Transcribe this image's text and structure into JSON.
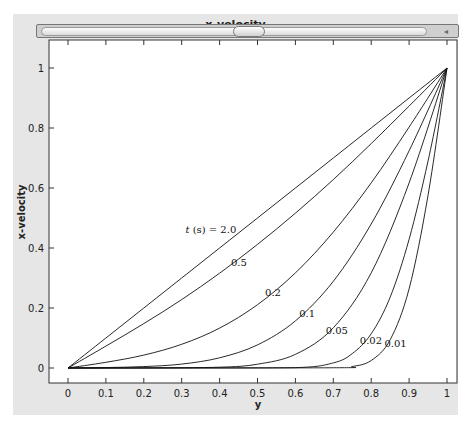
{
  "window": {
    "title": "x-velocity",
    "scrollbar": {
      "arrow_icon": "◂"
    }
  },
  "chart_data": {
    "type": "line",
    "title": "x-velocity",
    "xlabel": "y",
    "ylabel": "x-velocity",
    "xlim": [
      0,
      1
    ],
    "ylim": [
      0,
      1
    ],
    "grid": false,
    "legend": "inline curve labels",
    "xticks": [
      "0",
      "0.1",
      "0.2",
      "0.3",
      "0.4",
      "0.5",
      "0.6",
      "0.7",
      "0.8",
      "0.9",
      "1"
    ],
    "yticks": [
      "0",
      "0.2",
      "0.4",
      "0.6",
      "0.8",
      "1"
    ],
    "annotation_prefix": "t (s) = ",
    "series": [
      {
        "name": "2.0",
        "label": "t (s) = 2.0",
        "label_pos": [
          0.31,
          0.45
        ],
        "x": [
          0,
          0.1,
          0.2,
          0.3,
          0.4,
          0.5,
          0.6,
          0.7,
          0.8,
          0.9,
          1
        ],
        "y": [
          0,
          0.1,
          0.2,
          0.3,
          0.4,
          0.5,
          0.6,
          0.7,
          0.8,
          0.9,
          1
        ]
      },
      {
        "name": "0.5",
        "label": "0.5",
        "label_pos": [
          0.43,
          0.34
        ],
        "x": [
          0,
          0.1,
          0.2,
          0.3,
          0.4,
          0.5,
          0.6,
          0.7,
          0.8,
          0.9,
          1
        ],
        "y": [
          0,
          0.073,
          0.148,
          0.228,
          0.316,
          0.412,
          0.516,
          0.628,
          0.748,
          0.873,
          1
        ]
      },
      {
        "name": "0.2",
        "label": "0.2",
        "label_pos": [
          0.52,
          0.24
        ],
        "x": [
          0,
          0.1,
          0.2,
          0.3,
          0.4,
          0.5,
          0.6,
          0.7,
          0.8,
          0.9,
          1
        ],
        "y": [
          0,
          0.019,
          0.043,
          0.079,
          0.133,
          0.211,
          0.317,
          0.453,
          0.617,
          0.803,
          1
        ]
      },
      {
        "name": "0.1",
        "label": "0.1",
        "label_pos": [
          0.61,
          0.17
        ],
        "x": [
          0,
          0.1,
          0.2,
          0.3,
          0.4,
          0.5,
          0.6,
          0.7,
          0.8,
          0.9,
          1
        ],
        "y": [
          0,
          0.0015,
          0.0047,
          0.013,
          0.034,
          0.077,
          0.157,
          0.289,
          0.48,
          0.724,
          1
        ]
      },
      {
        "name": "0.05",
        "label": "0.05",
        "label_pos": [
          0.68,
          0.115
        ],
        "x": [
          0,
          0.2,
          0.4,
          0.5,
          0.6,
          0.7,
          0.8,
          0.9,
          1
        ],
        "y": [
          0,
          0.0003,
          0.0027,
          0.0127,
          0.0455,
          0.134,
          0.317,
          0.617,
          1
        ]
      },
      {
        "name": "0.02",
        "label": "0.02",
        "label_pos": [
          0.77,
          0.08
        ],
        "x": [
          0,
          0.3,
          0.6,
          0.7,
          0.75,
          0.8,
          0.85,
          0.9,
          0.95,
          1
        ],
        "y": [
          0,
          0.0003,
          0.0012,
          0.017,
          0.048,
          0.114,
          0.236,
          0.429,
          0.69,
          1
        ]
      },
      {
        "name": "0.01",
        "label": "0.01",
        "label_pos": [
          0.835,
          0.07
        ],
        "x": [
          0,
          0.1,
          0.7,
          0.75,
          0.8,
          0.85,
          0.9,
          0.95,
          1
        ],
        "y": [
          0,
          0.0,
          0.0008,
          0.0049,
          0.025,
          0.094,
          0.264,
          0.576,
          1
        ]
      }
    ]
  }
}
